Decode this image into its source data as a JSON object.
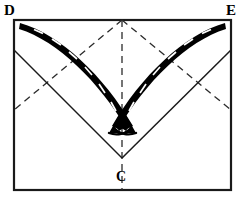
{
  "figure": {
    "canvas": {
      "width": 244,
      "height": 204
    },
    "background_color": "#ffffff",
    "ink_color": "#000000"
  },
  "labels": {
    "top_left": "D",
    "top_right": "E",
    "bottom_center": "C"
  },
  "sheet": {
    "name": "paper-sheet-outline",
    "shape": "rectangle",
    "stroke_color": "#1a1a1a",
    "stroke_width": 2.2,
    "corners": {
      "top_left": [
        14,
        20
      ],
      "top_right": [
        231,
        20
      ],
      "bottom_right": [
        231,
        190
      ],
      "bottom_left": [
        14,
        190
      ]
    }
  },
  "creases": {
    "dashed_stroke_color": "#2b2b2b",
    "dashed_stroke_width": 1.3,
    "dash_pattern": "7 5",
    "solid_stroke_color": "#1a1a1a",
    "solid_stroke_width": 1.5,
    "lines": [
      {
        "name": "vertical-center-crease",
        "style": "dashed",
        "from": [
          122,
          20
        ],
        "to": [
          122,
          190
        ]
      },
      {
        "name": "diagonal-crease-top-center-to-left-edge",
        "style": "dashed",
        "from": [
          122,
          20
        ],
        "to": [
          14,
          110
        ]
      },
      {
        "name": "diagonal-crease-top-center-to-right-edge",
        "style": "dashed",
        "from": [
          122,
          20
        ],
        "to": [
          231,
          110
        ]
      },
      {
        "name": "fold-line-left-edge-to-point-c",
        "style": "solid",
        "from": [
          14,
          50
        ],
        "to": [
          122,
          158
        ]
      },
      {
        "name": "fold-line-right-edge-to-point-c",
        "style": "solid",
        "from": [
          231,
          50
        ],
        "to": [
          122,
          158
        ]
      }
    ],
    "point_c": [
      122,
      158
    ]
  },
  "fold_arrows": [
    {
      "name": "fold-arrow-from-d",
      "origin_label": "D",
      "target_label": "C",
      "fill_color": "#000000",
      "tail": [
        20,
        24
      ],
      "head": [
        136,
        131
      ],
      "control": [
        96,
        52
      ],
      "dash_marks": 7
    },
    {
      "name": "fold-arrow-from-e",
      "origin_label": "E",
      "target_label": "C",
      "fill_color": "#000000",
      "tail": [
        225,
        24
      ],
      "head": [
        109,
        131
      ],
      "control": [
        149,
        52
      ],
      "dash_marks": 7
    }
  ]
}
